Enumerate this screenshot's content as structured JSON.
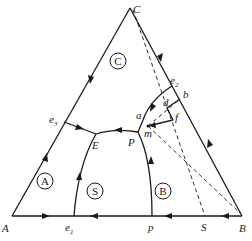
{
  "diagram": {
    "type": "ternary-phase-diagram",
    "vertices": {
      "A": {
        "label": "A"
      },
      "B": {
        "label": "B"
      },
      "C": {
        "label": "C"
      }
    },
    "points": {
      "e1": {
        "label": "e",
        "sub": "1"
      },
      "e2": {
        "label": "e",
        "sub": "2"
      },
      "e3": {
        "label": "e",
        "sub": "3"
      },
      "E": {
        "label": "E"
      },
      "P": {
        "label": "P"
      },
      "p": {
        "label": "p"
      },
      "S": {
        "label": "S"
      },
      "a": {
        "label": "a"
      },
      "b": {
        "label": "b"
      },
      "d": {
        "label": "d"
      },
      "f": {
        "label": "f"
      },
      "m": {
        "label": "m"
      }
    },
    "regions": [
      {
        "id": "C",
        "label": "C"
      },
      {
        "id": "A",
        "label": "A"
      },
      {
        "id": "S",
        "label": "S"
      },
      {
        "id": "B",
        "label": "B"
      }
    ],
    "curves": [
      {
        "from": "e3",
        "to": "E",
        "style": "solid",
        "arrow": "toward E"
      },
      {
        "from": "e1",
        "to": "E",
        "style": "solid",
        "arrow": "toward E"
      },
      {
        "from": "P",
        "to": "E",
        "style": "solid",
        "arrow": "toward E"
      },
      {
        "from": "p",
        "to": "P",
        "style": "solid",
        "arrow": "toward P"
      },
      {
        "from": "e2",
        "to": "P",
        "style": "solid",
        "arrow": "toward P"
      },
      {
        "from": "C",
        "to": "S",
        "style": "dashed"
      },
      {
        "from": "B",
        "to": "m",
        "style": "dashed"
      },
      {
        "from": "b",
        "to": "m",
        "style": "dashed"
      },
      {
        "from": "d",
        "to": "f",
        "style": "solid"
      },
      {
        "from": "b",
        "to": "d",
        "style": "solid"
      },
      {
        "from": "f",
        "to": "m",
        "style": "solid",
        "arrow": "toward m"
      }
    ]
  }
}
